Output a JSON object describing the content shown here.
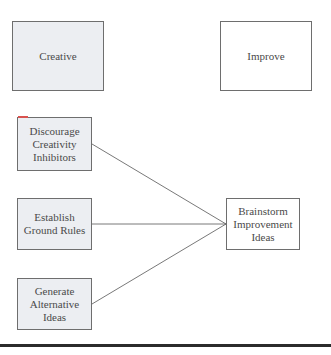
{
  "diagram": {
    "top_row": {
      "left_label": "Creative",
      "right_label": "Improve"
    },
    "inputs": [
      {
        "label": "Discourage\nCreativity\nInhibitors"
      },
      {
        "label": "Establish\nGround Rules"
      },
      {
        "label": "Generate\nAlternative\nIdeas"
      }
    ],
    "output": {
      "label": "Brainstorm\nImprovement\nIdeas"
    },
    "colors": {
      "shaded_fill": "#eceef2",
      "plain_fill": "#ffffff",
      "border": "#6e6e6e",
      "line": "#555555",
      "rule": "#2b2b2b",
      "accent_tick": "#d9534f"
    }
  }
}
